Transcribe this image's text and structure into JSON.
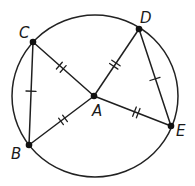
{
  "diagram": {
    "circle": {
      "cx": 95,
      "cy": 96,
      "rx": 83,
      "ry": 81,
      "center_label": "A"
    },
    "points": {
      "A": {
        "label": "A",
        "x": 94,
        "y": 96,
        "label_x": 92,
        "label_y": 116
      },
      "B": {
        "label": "B",
        "x": 29,
        "y": 145,
        "label_x": 11,
        "label_y": 159
      },
      "C": {
        "label": "C",
        "x": 33,
        "y": 42,
        "label_x": 19,
        "label_y": 38
      },
      "D": {
        "label": "D",
        "x": 139,
        "y": 29,
        "label_x": 140,
        "label_y": 23
      },
      "E": {
        "label": "E",
        "x": 171,
        "y": 126,
        "label_x": 176,
        "label_y": 136
      }
    },
    "segments": [
      {
        "name": "CB",
        "from": "C",
        "to": "B",
        "ticks": 1
      },
      {
        "name": "DE",
        "from": "D",
        "to": "E",
        "ticks": 1
      },
      {
        "name": "CA",
        "from": "C",
        "to": "A",
        "ticks": 2
      },
      {
        "name": "BA",
        "from": "B",
        "to": "A",
        "ticks": 2
      },
      {
        "name": "DA",
        "from": "D",
        "to": "A",
        "ticks": 2
      },
      {
        "name": "AE",
        "from": "A",
        "to": "E",
        "ticks": 2
      }
    ],
    "congruence_notes": [
      "CB ≅ DE (single tick marks)",
      "AC ≅ AB ≅ AD ≅ AE (double tick marks, radii)"
    ],
    "colors": {
      "stroke": "#1f1f1f",
      "background": "#ffffff"
    }
  }
}
